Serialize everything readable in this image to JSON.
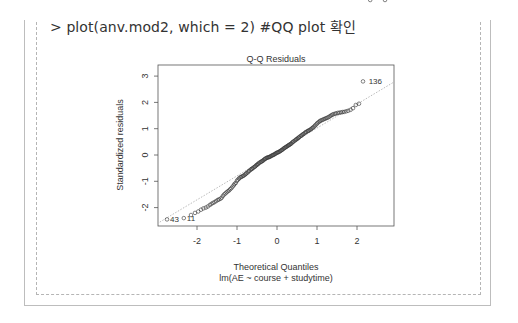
{
  "command": {
    "prompt": ">",
    "text": "> plot(anv.mod2, which = 2) #QQ plot 확인"
  },
  "chart_data": {
    "type": "scatter",
    "title": "Q-Q Residuals",
    "xlabel": "Theoretical Quantiles",
    "sublabel": "lm(AE ~ course + studytime)",
    "ylabel": "Standardized residuals",
    "xlim": [
      -2.95,
      2.95
    ],
    "ylim": [
      -2.7,
      3.5
    ],
    "xticks": [
      -2,
      -1,
      0,
      1,
      2
    ],
    "yticks": [
      -2,
      -1,
      0,
      1,
      2,
      3
    ],
    "grid": false,
    "reference_line": {
      "x0": -2.93,
      "y0": -2.55,
      "x1": 2.93,
      "y1": 2.78,
      "color": "#aaaaaa",
      "style": "dotted"
    },
    "labeled_points": [
      {
        "label": "43",
        "x": -2.75,
        "y": -2.45
      },
      {
        "label": "11",
        "x": -2.33,
        "y": -2.4
      },
      {
        "label": "136",
        "x": 2.7,
        "y": 2.8
      }
    ],
    "points_x": [
      -2.75,
      -2.33,
      -2.15,
      -2.05,
      -1.97,
      -1.9,
      -1.84,
      -1.78,
      -1.73,
      -1.68,
      -1.64,
      -1.6,
      -1.56,
      -1.52,
      -1.48,
      -1.45,
      -1.41,
      -1.38,
      -1.35,
      -1.32,
      -1.29,
      -1.26,
      -1.23,
      -1.2,
      -1.17,
      -1.14,
      -1.11,
      -1.08,
      -1.06,
      -1.03,
      -1.0,
      -0.98,
      -0.95,
      -0.93,
      -0.9,
      -0.88,
      -0.85,
      -0.83,
      -0.8,
      -0.78,
      -0.76,
      -0.73,
      -0.71,
      -0.69,
      -0.66,
      -0.64,
      -0.62,
      -0.6,
      -0.57,
      -0.55,
      -0.53,
      -0.51,
      -0.49,
      -0.47,
      -0.45,
      -0.42,
      -0.4,
      -0.38,
      -0.36,
      -0.34,
      -0.32,
      -0.3,
      -0.28,
      -0.26,
      -0.24,
      -0.22,
      -0.2,
      -0.18,
      -0.16,
      -0.14,
      -0.12,
      -0.1,
      -0.08,
      -0.06,
      -0.04,
      -0.02,
      0.0,
      0.02,
      0.04,
      0.06,
      0.08,
      0.1,
      0.12,
      0.14,
      0.16,
      0.18,
      0.2,
      0.22,
      0.24,
      0.26,
      0.28,
      0.3,
      0.32,
      0.34,
      0.36,
      0.38,
      0.4,
      0.42,
      0.45,
      0.47,
      0.49,
      0.51,
      0.53,
      0.55,
      0.57,
      0.6,
      0.62,
      0.64,
      0.66,
      0.69,
      0.71,
      0.73,
      0.76,
      0.78,
      0.8,
      0.83,
      0.85,
      0.88,
      0.9,
      0.93,
      0.95,
      0.98,
      1.0,
      1.03,
      1.06,
      1.08,
      1.11,
      1.14,
      1.17,
      1.2,
      1.23,
      1.26,
      1.29,
      1.32,
      1.35,
      1.38,
      1.41,
      1.45,
      1.48,
      1.52,
      1.56,
      1.6,
      1.64,
      1.68,
      1.73,
      1.78,
      1.84,
      1.9,
      1.97,
      2.05,
      2.15,
      2.33,
      2.7
    ],
    "points_y": [
      -2.45,
      -2.4,
      -2.28,
      -2.2,
      -2.15,
      -2.08,
      -2.03,
      -2.0,
      -1.96,
      -1.9,
      -1.86,
      -1.82,
      -1.79,
      -1.75,
      -1.71,
      -1.69,
      -1.66,
      -1.62,
      -1.55,
      -1.5,
      -1.46,
      -1.42,
      -1.38,
      -1.35,
      -1.3,
      -1.26,
      -1.2,
      -1.15,
      -1.1,
      -1.06,
      -0.98,
      -0.94,
      -0.9,
      -0.86,
      -0.84,
      -0.82,
      -0.8,
      -0.78,
      -0.75,
      -0.72,
      -0.69,
      -0.66,
      -0.62,
      -0.6,
      -0.56,
      -0.54,
      -0.52,
      -0.49,
      -0.46,
      -0.44,
      -0.41,
      -0.38,
      -0.36,
      -0.34,
      -0.3,
      -0.28,
      -0.26,
      -0.24,
      -0.22,
      -0.2,
      -0.17,
      -0.15,
      -0.13,
      -0.11,
      -0.1,
      -0.09,
      -0.08,
      -0.07,
      -0.05,
      -0.03,
      -0.02,
      0.0,
      0.01,
      0.03,
      0.05,
      0.07,
      0.09,
      0.1,
      0.11,
      0.13,
      0.15,
      0.17,
      0.19,
      0.21,
      0.24,
      0.26,
      0.28,
      0.3,
      0.32,
      0.34,
      0.36,
      0.38,
      0.4,
      0.42,
      0.44,
      0.47,
      0.5,
      0.52,
      0.55,
      0.58,
      0.6,
      0.62,
      0.65,
      0.67,
      0.7,
      0.73,
      0.75,
      0.78,
      0.8,
      0.83,
      0.86,
      0.88,
      0.9,
      0.92,
      0.94,
      0.96,
      0.99,
      1.02,
      1.05,
      1.08,
      1.12,
      1.16,
      1.2,
      1.24,
      1.27,
      1.3,
      1.32,
      1.34,
      1.36,
      1.38,
      1.4,
      1.42,
      1.44,
      1.47,
      1.5,
      1.53,
      1.55,
      1.57,
      1.58,
      1.6,
      1.61,
      1.62,
      1.63,
      1.64,
      1.66,
      1.68,
      1.72,
      1.78,
      1.9,
      1.95,
      2.8
    ]
  }
}
